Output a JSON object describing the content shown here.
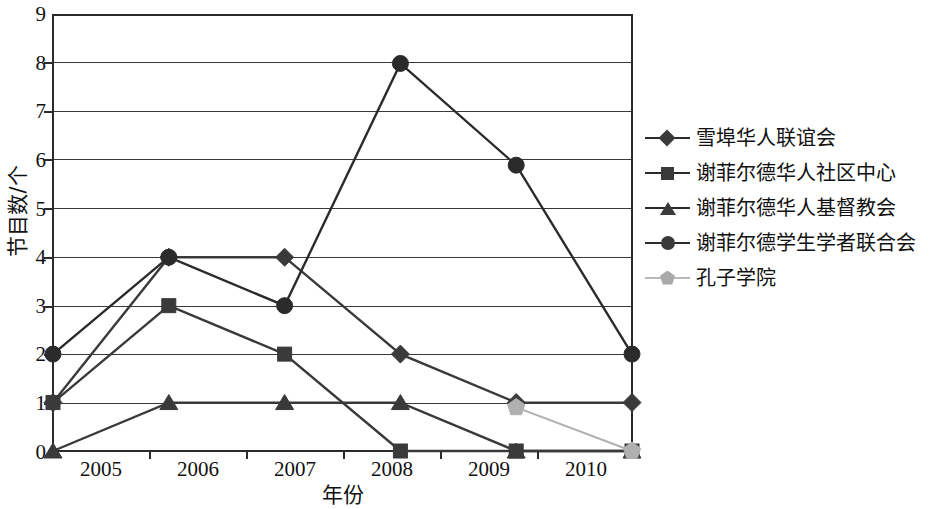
{
  "chart_data": {
    "type": "line",
    "title": "",
    "xlabel": "年份",
    "ylabel": "节目数/个",
    "categories": [
      "2005",
      "2006",
      "2007",
      "2008",
      "2009",
      "2010"
    ],
    "xlim": [
      2005,
      2010
    ],
    "ylim": [
      0,
      9
    ],
    "yticks": [
      "0",
      "1",
      "2",
      "3",
      "4",
      "5",
      "6",
      "7",
      "8",
      "9"
    ],
    "grid": true,
    "legend_position": "right",
    "series": [
      {
        "name": "雪埠华人联谊会",
        "marker": "diamond",
        "color": "#3a3a3a",
        "values": [
          1,
          4,
          4,
          2,
          1,
          1
        ]
      },
      {
        "name": "谢菲尔德华人社区中心",
        "marker": "square",
        "color": "#3a3a3a",
        "values": [
          1,
          3,
          2,
          0,
          0,
          0
        ]
      },
      {
        "name": "谢菲尔德华人基督教会",
        "marker": "triangle",
        "color": "#3a3a3a",
        "values": [
          0,
          1,
          1,
          1,
          0,
          0
        ]
      },
      {
        "name": "谢菲尔德学生学者联合会",
        "marker": "circle",
        "color": "#2b2b2b",
        "values": [
          2,
          4,
          3,
          8,
          5.9,
          2
        ]
      },
      {
        "name": "孔子学院",
        "marker": "pentagon",
        "color": "#b0b0b0",
        "values": [
          null,
          null,
          null,
          null,
          0.9,
          0
        ]
      }
    ]
  },
  "axes": {
    "x_title": "年份",
    "y_title": "节目数/个",
    "x_tick_labels": [
      "2005",
      "2006",
      "2007",
      "2008",
      "2009",
      "2010"
    ],
    "y_tick_labels": [
      "9",
      "8",
      "7",
      "6",
      "5",
      "4",
      "3",
      "2",
      "1",
      "0"
    ]
  },
  "legend": {
    "items": [
      {
        "label": "雪埠华人联谊会",
        "marker": "diamond-marker"
      },
      {
        "label": "谢菲尔德华人社区中心",
        "marker": "square-marker"
      },
      {
        "label": "谢菲尔德华人基督教会",
        "marker": "triangle-marker"
      },
      {
        "label": "谢菲尔德学生学者联合会",
        "marker": "circle-marker"
      },
      {
        "label": "孔子学院",
        "marker": "pentagon-marker"
      }
    ]
  },
  "colors": {
    "axis": "#2b2b2b",
    "grid": "#3a3a3a",
    "series_dark": "#3a3a3a",
    "series_light": "#b0b0b0",
    "background": "#ffffff"
  }
}
